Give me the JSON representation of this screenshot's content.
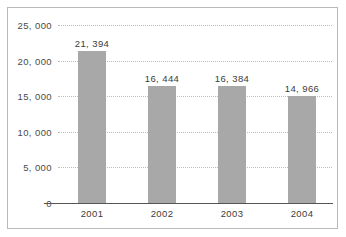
{
  "chart_data": {
    "type": "bar",
    "title": "",
    "subtitle": "",
    "xlabel": "",
    "ylabel": "",
    "categories": [
      "2001",
      "2002",
      "2003",
      "2004"
    ],
    "values": [
      21394,
      16444,
      16384,
      14966
    ],
    "data_labels": [
      "21, 394",
      "16, 444",
      "16, 384",
      "14, 966"
    ],
    "ylim": [
      0,
      25000
    ],
    "ytick_values": [
      0,
      5000,
      10000,
      15000,
      20000,
      25000
    ],
    "ytick_labels": [
      "0",
      "5, 000",
      "10, 000",
      "15, 000",
      "20, 000",
      "25, 000"
    ],
    "grid": true,
    "grid_style": "dotted-horizontal",
    "legend": null,
    "legend_position": "none",
    "bar_color": "#a8a8a8",
    "axis_color": "#555555",
    "gridline_color": "#bdbdbd",
    "border_color": "#b9b9b9",
    "background_color": "#ffffff",
    "text_color": "#3c3c3c"
  }
}
